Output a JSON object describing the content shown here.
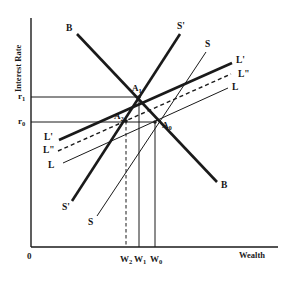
{
  "figure": {
    "width": 285,
    "height": 283,
    "background": "#ffffff",
    "ink": "#1a1a1a"
  },
  "axes": {
    "y_title": "Interest Rate",
    "x_title": "Wealth",
    "origin_label": "0",
    "x_axis_y": 247,
    "y_axis_x": 31,
    "y_axis_top": 18,
    "x_axis_right": 278
  },
  "y_ticks": [
    {
      "label": "r",
      "sub": "1",
      "y": 97,
      "x": 18
    },
    {
      "label": "r",
      "sub": "0",
      "y": 122,
      "x": 18
    }
  ],
  "x_ticks": [
    {
      "label": "W",
      "sub": "2",
      "x": 126,
      "y": 255
    },
    {
      "label": "W",
      "sub": "1",
      "x": 140,
      "y": 255
    },
    {
      "label": "W",
      "sub": "0",
      "x": 156,
      "y": 255
    }
  ],
  "points": [
    {
      "name": "A",
      "sub": "1",
      "x": 139,
      "y": 97,
      "label_x": 132,
      "label_y": 84
    },
    {
      "name": "A",
      "sub": "2",
      "x": 126,
      "y": 121,
      "label_x": 114,
      "label_y": 112
    },
    {
      "name": "A",
      "sub": "0",
      "x": 155,
      "y": 122,
      "label_x": 162,
      "label_y": 121
    }
  ],
  "chart_data": {
    "type": "line",
    "title": "",
    "xlabel": "Wealth",
    "ylabel": "Interest Rate",
    "xlim": [
      0,
      1
    ],
    "ylim": [
      0,
      1
    ],
    "grid": false,
    "legend": "inline-curve-labels",
    "annotations": [
      "A0 = initial equilibrium at (W0, r0)",
      "A1 = new equilibrium at (W1, r1) after supply shift S to S'",
      "A2 = intermediate equilibrium at (W2, r0)"
    ],
    "series": [
      {
        "name": "B",
        "style": "solid-thick",
        "width": 2.6,
        "label_start": "B",
        "label_end": "B",
        "points": [
          [
            77,
            34
          ],
          [
            217,
            182
          ]
        ]
      },
      {
        "name": "S",
        "style": "solid-thin",
        "width": 1.0,
        "label_start": "S",
        "label_end": "S",
        "points": [
          [
            97,
            216
          ],
          [
            206,
            52
          ]
        ]
      },
      {
        "name": "S'",
        "style": "solid-thick",
        "width": 2.6,
        "label_start": "S'",
        "label_end": "S'",
        "points": [
          [
            72,
            201
          ],
          [
            180,
            34
          ]
        ]
      },
      {
        "name": "L",
        "style": "solid-thin",
        "width": 1.0,
        "label_start": "L",
        "label_end": "L",
        "points": [
          [
            63,
            163
          ],
          [
            228,
            88
          ]
        ]
      },
      {
        "name": "L'",
        "style": "solid-thick",
        "width": 2.6,
        "label_start": "L'",
        "label_end": "L'",
        "points": [
          [
            59,
            140
          ],
          [
            232,
            63
          ]
        ]
      },
      {
        "name": "L\"",
        "style": "dashed",
        "width": 1.4,
        "label_start": "L\"",
        "label_end": "L\"",
        "points": [
          [
            58,
            151
          ],
          [
            231,
            74
          ]
        ]
      }
    ],
    "guide_lines": [
      {
        "name": "r1-horizontal",
        "style": "solid-thin",
        "points": [
          [
            31,
            97
          ],
          [
            139,
            97
          ]
        ]
      },
      {
        "name": "r0-horizontal",
        "style": "solid-thin",
        "points": [
          [
            31,
            122
          ],
          [
            155,
            122
          ]
        ]
      },
      {
        "name": "W1-vertical",
        "style": "solid-thin",
        "points": [
          [
            139,
            97
          ],
          [
            139,
            247
          ]
        ]
      },
      {
        "name": "W0-vertical",
        "style": "solid-thin",
        "points": [
          [
            155,
            122
          ],
          [
            155,
            247
          ]
        ]
      },
      {
        "name": "W2-vertical",
        "style": "dashed",
        "points": [
          [
            126,
            121
          ],
          [
            126,
            247
          ]
        ]
      }
    ]
  },
  "curve_labels": [
    {
      "id": "B-top",
      "text": "B",
      "x": 66,
      "y": 24
    },
    {
      "id": "B-bottom",
      "text": "B",
      "x": 221,
      "y": 181
    },
    {
      "id": "S-prime-top",
      "text": "S'",
      "x": 177,
      "y": 22
    },
    {
      "id": "S-top",
      "text": "S",
      "x": 205,
      "y": 40
    },
    {
      "id": "L-prime-right",
      "text": "L'",
      "x": 236,
      "y": 56
    },
    {
      "id": "L-dprime-right",
      "text": "L\"",
      "x": 238,
      "y": 70
    },
    {
      "id": "L-right",
      "text": "L",
      "x": 232,
      "y": 83
    },
    {
      "id": "L-prime-left",
      "text": "L'",
      "x": 44,
      "y": 133
    },
    {
      "id": "L-dprime-left",
      "text": "L\"",
      "x": 43,
      "y": 146
    },
    {
      "id": "L-left",
      "text": "L",
      "x": 48,
      "y": 161
    },
    {
      "id": "S-prime-bottom",
      "text": "S'",
      "x": 62,
      "y": 203
    },
    {
      "id": "S-bottom",
      "text": "S",
      "x": 88,
      "y": 218
    }
  ]
}
